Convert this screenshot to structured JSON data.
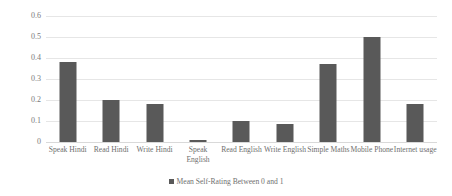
{
  "chart_data": {
    "type": "bar",
    "title": "",
    "subtitle": "",
    "xlabel": "",
    "ylabel": "",
    "categories": [
      "Speak Hindi",
      "Read Hindi",
      "Write Hindi",
      "Speak English",
      "Read English",
      "Write English",
      "Simple Maths",
      "Mobile Phone",
      "Internet usage"
    ],
    "series": [
      {
        "name": "Mean Self-Rating Between 0 and 1",
        "values": [
          0.38,
          0.2,
          0.18,
          0.01,
          0.1,
          0.085,
          0.37,
          0.5,
          0.18
        ],
        "color": "#595959"
      }
    ],
    "ylim": [
      0,
      0.6
    ],
    "yticks": [
      "0",
      "0.1",
      "0.2",
      "0.3",
      "0.4",
      "0.5",
      "0.6"
    ],
    "ytick_values": [
      0,
      0.1,
      0.2,
      0.3,
      0.4,
      0.5,
      0.6
    ],
    "grid": true,
    "grid_axis": "y",
    "legend": {
      "position": "bottom-center",
      "entries": [
        {
          "label": "Mean Self-Rating Between 0 and 1",
          "color": "#595959"
        }
      ]
    },
    "colors": {
      "bar": "#595959",
      "gridline": "#e6e6e6",
      "baseline": "#d9d9d9",
      "text": "#6f6f6f",
      "background": "#ffffff"
    }
  }
}
